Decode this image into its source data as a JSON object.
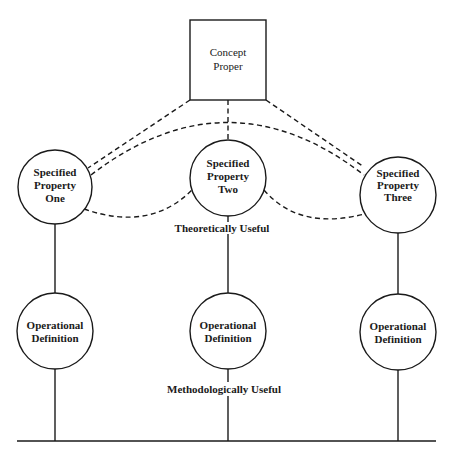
{
  "diagram": {
    "concept": {
      "lines": [
        "Concept",
        "Proper"
      ]
    },
    "specified_properties": [
      {
        "lines": [
          "Specified",
          "Property",
          "One"
        ]
      },
      {
        "lines": [
          "Specified",
          "Property",
          "Two"
        ]
      },
      {
        "lines": [
          "Specified",
          "Property",
          "Three"
        ]
      }
    ],
    "operational_definitions": [
      {
        "lines": [
          "Operational",
          "Definition"
        ]
      },
      {
        "lines": [
          "Operational",
          "Definition"
        ]
      },
      {
        "lines": [
          "Operational",
          "Definition"
        ]
      }
    ],
    "labels": {
      "theoretical": "Theoretically Useful",
      "methodological": "Methodologically Useful"
    }
  }
}
